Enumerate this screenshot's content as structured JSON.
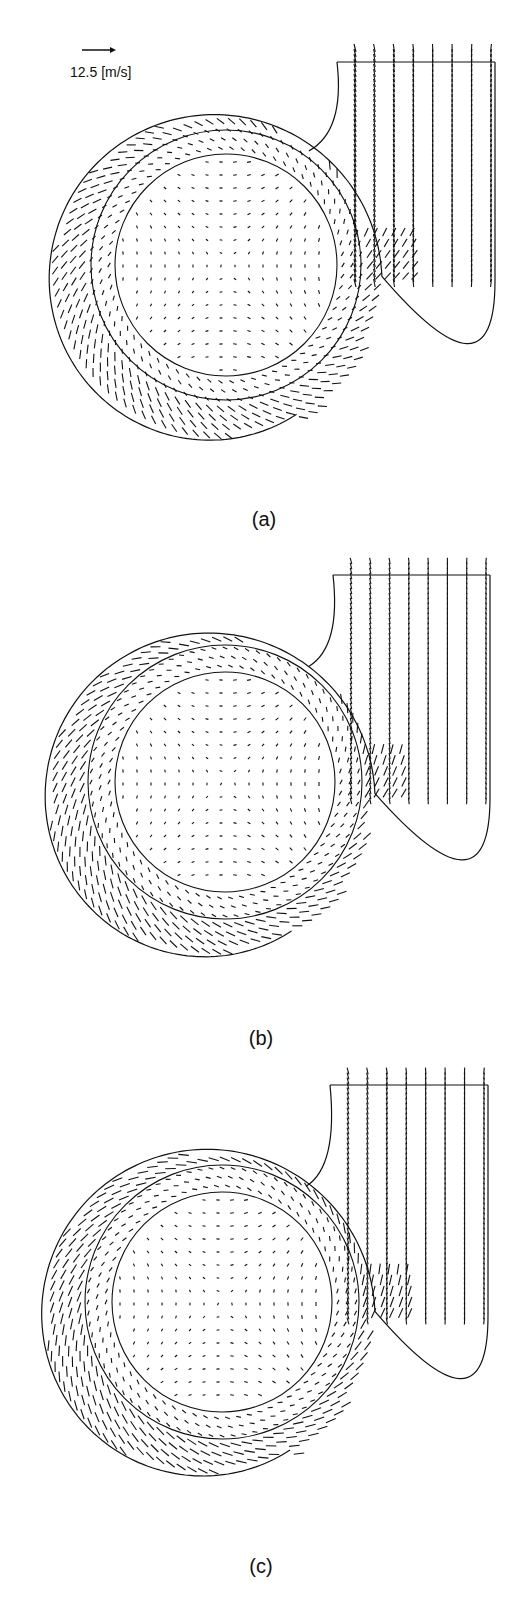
{
  "figure": {
    "scale_reference": {
      "value": 12.5,
      "unit": "[m/s]",
      "label": "12.5 [m/s]",
      "icon": "arrow-right-icon"
    },
    "panels": [
      {
        "id": "a",
        "caption": "(a)",
        "flow_mode": "moderate",
        "swirl": 0.55,
        "outlet_jet": 1.0
      },
      {
        "id": "b",
        "caption": "(b)",
        "flow_mode": "tangential",
        "swirl": 0.75,
        "outlet_jet": 0.8
      },
      {
        "id": "c",
        "caption": "(c)",
        "flow_mode": "strong-radial",
        "swirl": 0.9,
        "outlet_jet": 0.85
      }
    ]
  }
}
